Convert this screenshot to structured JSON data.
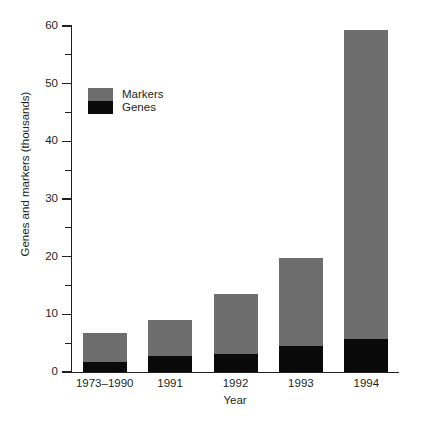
{
  "chart_data": {
    "type": "bar",
    "stacked": true,
    "title": "",
    "xlabel": "Year",
    "ylabel": "Genes and markers (thousands)",
    "categories": [
      "1973–1990",
      "1991",
      "1992",
      "1993",
      "1994"
    ],
    "series": [
      {
        "name": "Genes",
        "color": "#0a0a0a",
        "values": [
          1.7,
          2.8,
          3.1,
          4.5,
          5.7
        ]
      },
      {
        "name": "Markers",
        "color": "#6d6d6d",
        "values": [
          5.1,
          6.2,
          10.4,
          15.2,
          53.6
        ]
      }
    ],
    "totals": [
      6.8,
      9.0,
      13.5,
      19.7,
      59.3
    ],
    "ylim": [
      0,
      60
    ],
    "yticks": [
      0,
      10,
      20,
      30,
      40,
      50,
      60
    ],
    "ytick_labels": [
      "0",
      "10",
      "20",
      "30",
      "40",
      "50",
      "60"
    ],
    "yminor_ticks": [
      5,
      15,
      25,
      35,
      45,
      55
    ],
    "grid": false,
    "legend_position": "upper-left",
    "legend_entries": [
      {
        "label": "Markers",
        "color": "#6d6d6d"
      },
      {
        "label": "Genes",
        "color": "#0a0a0a"
      }
    ],
    "axis_color": "#231f20",
    "background": "#ffffff"
  }
}
